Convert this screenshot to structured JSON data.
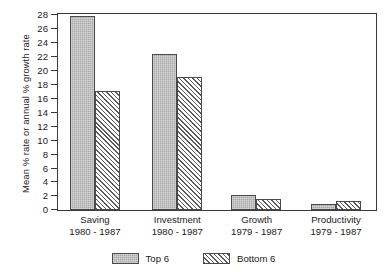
{
  "chart_data": {
    "type": "bar",
    "title": "",
    "xlabel": "",
    "ylabel": "Mean % rate or annual % growth rate",
    "ylim": [
      0,
      28
    ],
    "ytick_step": 2,
    "yticks": [
      0,
      2,
      4,
      6,
      8,
      10,
      12,
      14,
      16,
      18,
      20,
      22,
      24,
      26,
      28
    ],
    "ytick_labels": [
      "0",
      "2",
      "4",
      "6",
      "8",
      "10",
      "12",
      "14",
      "16",
      "18",
      "20",
      "22",
      "24",
      "26",
      "28"
    ],
    "grid": false,
    "legend_position": "bottom-center",
    "categories": [
      "Saving",
      "Investment",
      "Growth",
      "Productivity"
    ],
    "category_periods": [
      "1980 - 1987",
      "1980 - 1987",
      "1979 - 1987",
      "1979 - 1987"
    ],
    "series": [
      {
        "name": "Top 6",
        "values": [
          27.8,
          22.3,
          2.2,
          0.9
        ]
      },
      {
        "name": "Bottom 6",
        "values": [
          17.0,
          19.0,
          1.6,
          1.3
        ]
      }
    ]
  },
  "legend": {
    "entries": [
      {
        "label": "Top 6",
        "swatch": "solid-gray-swatch"
      },
      {
        "label": "Bottom 6",
        "swatch": "diagonal-hatch-swatch"
      }
    ]
  },
  "colors": {
    "top6_fill": "#a8a8a8",
    "bottom6_fill": "#ffffff",
    "bottom6_hatch": "#5c5c5c",
    "bar_outline": "#4a4a4a",
    "axis": "#3a3a3a",
    "text": "#1b1b1b",
    "background": "#ffffff"
  }
}
